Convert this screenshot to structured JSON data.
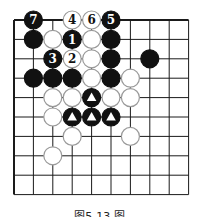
{
  "diagram": {
    "type": "go-board",
    "colors": {
      "line": "#1a1a1a",
      "black_stone": "#111111",
      "white_stone": "#ffffff",
      "white_stroke": "#9a9a9a",
      "marker_on_black": "#ffffff"
    },
    "grid": {
      "x": [
        14,
        33.4,
        52.8,
        72.2,
        91.6,
        111,
        130.4,
        149.8,
        169.2,
        188.6
      ],
      "y": [
        20,
        39.4,
        58.8,
        78.2,
        97.6,
        117,
        136.4,
        155.8,
        175.2,
        194.6
      ],
      "left_edge": true,
      "top_edge": true,
      "stone_radius": 9
    },
    "stones": [
      {
        "c": 1,
        "r": 0,
        "color": "black",
        "label": "7"
      },
      {
        "c": 3,
        "r": 0,
        "color": "white",
        "label": "4"
      },
      {
        "c": 4,
        "r": 0,
        "color": "white",
        "label": "6"
      },
      {
        "c": 5,
        "r": 0,
        "color": "black",
        "label": "5"
      },
      {
        "c": 1,
        "r": 1,
        "color": "black",
        "label": ""
      },
      {
        "c": 2,
        "r": 1,
        "color": "white",
        "label": ""
      },
      {
        "c": 3,
        "r": 1,
        "color": "black",
        "label": "1"
      },
      {
        "c": 4,
        "r": 1,
        "color": "white",
        "label": ""
      },
      {
        "c": 5,
        "r": 1,
        "color": "black",
        "label": ""
      },
      {
        "c": 2,
        "r": 2,
        "color": "black",
        "label": "3"
      },
      {
        "c": 3,
        "r": 2,
        "color": "white",
        "label": "2"
      },
      {
        "c": 4,
        "r": 2,
        "color": "white",
        "label": ""
      },
      {
        "c": 5,
        "r": 2,
        "color": "black",
        "label": ""
      },
      {
        "c": 7,
        "r": 2,
        "color": "black",
        "label": ""
      },
      {
        "c": 1,
        "r": 3,
        "color": "black",
        "label": ""
      },
      {
        "c": 2,
        "r": 3,
        "color": "black",
        "label": ""
      },
      {
        "c": 3,
        "r": 3,
        "color": "black",
        "label": ""
      },
      {
        "c": 4,
        "r": 3,
        "color": "white",
        "label": ""
      },
      {
        "c": 5,
        "r": 3,
        "color": "black",
        "label": ""
      },
      {
        "c": 6,
        "r": 3,
        "color": "white",
        "label": ""
      },
      {
        "c": 2,
        "r": 4,
        "color": "white",
        "label": ""
      },
      {
        "c": 3,
        "r": 4,
        "color": "white",
        "label": ""
      },
      {
        "c": 4,
        "r": 4,
        "color": "black",
        "label": "",
        "marker": "triangle"
      },
      {
        "c": 5,
        "r": 4,
        "color": "white",
        "label": ""
      },
      {
        "c": 6,
        "r": 4,
        "color": "white",
        "label": ""
      },
      {
        "c": 2,
        "r": 5,
        "color": "white",
        "label": ""
      },
      {
        "c": 3,
        "r": 5,
        "color": "black",
        "label": "",
        "marker": "triangle"
      },
      {
        "c": 4,
        "r": 5,
        "color": "black",
        "label": "",
        "marker": "triangle"
      },
      {
        "c": 5,
        "r": 5,
        "color": "black",
        "label": "",
        "marker": "triangle"
      },
      {
        "c": 3,
        "r": 6,
        "color": "white",
        "label": ""
      },
      {
        "c": 6,
        "r": 6,
        "color": "white",
        "label": ""
      },
      {
        "c": 2,
        "r": 7,
        "color": "white",
        "label": ""
      }
    ],
    "caption": "图5-13 图"
  }
}
